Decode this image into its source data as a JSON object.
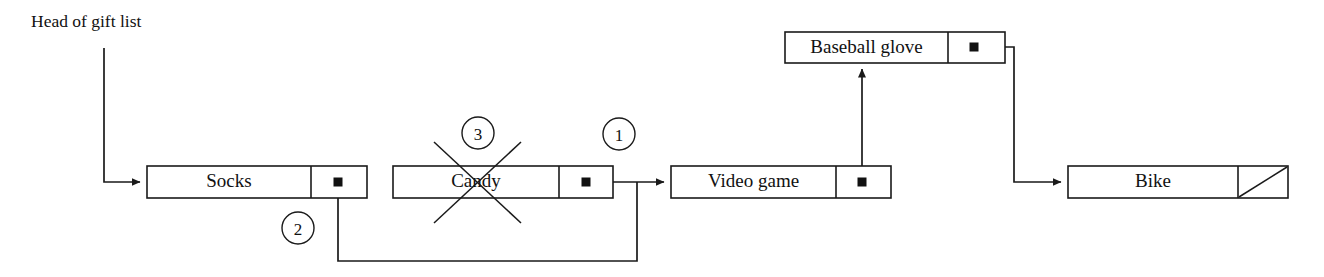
{
  "diagram": {
    "type": "linked-list-deletion",
    "caption": "Head of gift list",
    "colors": {
      "stroke": "#1a1a1a",
      "text": "#111111",
      "background": "#ffffff",
      "dot": "#111111"
    },
    "nodes": [
      {
        "id": "socks",
        "label": "Socks",
        "box": {
          "x": 147,
          "y": 166,
          "w": 220,
          "h": 32
        },
        "divider_x": 311,
        "dot": {
          "x": 338,
          "y": 182
        },
        "pointer_kind": "dot",
        "deleted": false
      },
      {
        "id": "candy",
        "label": "Candy",
        "box": {
          "x": 393,
          "y": 166,
          "w": 220,
          "h": 32
        },
        "divider_x": 559,
        "dot": {
          "x": 586,
          "y": 182
        },
        "pointer_kind": "dot",
        "deleted": true
      },
      {
        "id": "video-game",
        "label": "Video game",
        "box": {
          "x": 671,
          "y": 166,
          "w": 220,
          "h": 32
        },
        "divider_x": 836,
        "dot": {
          "x": 862,
          "y": 182
        },
        "pointer_kind": "dot",
        "deleted": false
      },
      {
        "id": "baseball-glove",
        "label": "Baseball glove",
        "box": {
          "x": 785,
          "y": 32,
          "w": 220,
          "h": 31
        },
        "divider_x": 948,
        "dot": {
          "x": 974,
          "y": 47
        },
        "pointer_kind": "dot",
        "deleted": false
      },
      {
        "id": "bike",
        "label": "Bike",
        "box": {
          "x": 1068,
          "y": 166,
          "w": 220,
          "h": 32
        },
        "divider_x": 1238,
        "dot": null,
        "pointer_kind": "null-slash",
        "deleted": false
      }
    ],
    "steps": [
      {
        "id": "step-1",
        "number": "1",
        "cx": 619,
        "cy": 134,
        "r": 16
      },
      {
        "id": "step-2",
        "number": "2",
        "cx": 298,
        "cy": 228,
        "r": 16
      },
      {
        "id": "step-3",
        "number": "3",
        "cx": 478,
        "cy": 133,
        "r": 16
      }
    ],
    "links": [
      {
        "id": "head-to-socks",
        "from": "head",
        "to": "socks",
        "points": "104,48 104,182 140,182",
        "arrow": true
      },
      {
        "id": "socks-to-video-game",
        "from": "socks",
        "to": "video-game",
        "points": "338,182 338,261 637,261 637,182",
        "arrow": false
      },
      {
        "id": "candy-to-video-game",
        "from": "candy",
        "to": "video-game",
        "points": "586,182 664,182",
        "arrow": true
      },
      {
        "id": "video-game-to-baseball-glove",
        "from": "video-game",
        "to": "baseball-glove",
        "points": "862,182 862,69",
        "arrow": true
      },
      {
        "id": "baseball-glove-to-bike",
        "from": "baseball-glove",
        "to": "bike",
        "points": "974,47 1014,47 1014,182 1061,182",
        "arrow": true
      }
    ],
    "strike": {
      "id": "candy-strike",
      "lines": [
        {
          "x1": 434,
          "y1": 142,
          "x2": 521,
          "y2": 223
        },
        {
          "x1": 521,
          "y1": 142,
          "x2": 434,
          "y2": 223
        }
      ]
    },
    "caption_pos": {
      "x": 31,
      "y": 27
    },
    "dot_size": 9
  }
}
